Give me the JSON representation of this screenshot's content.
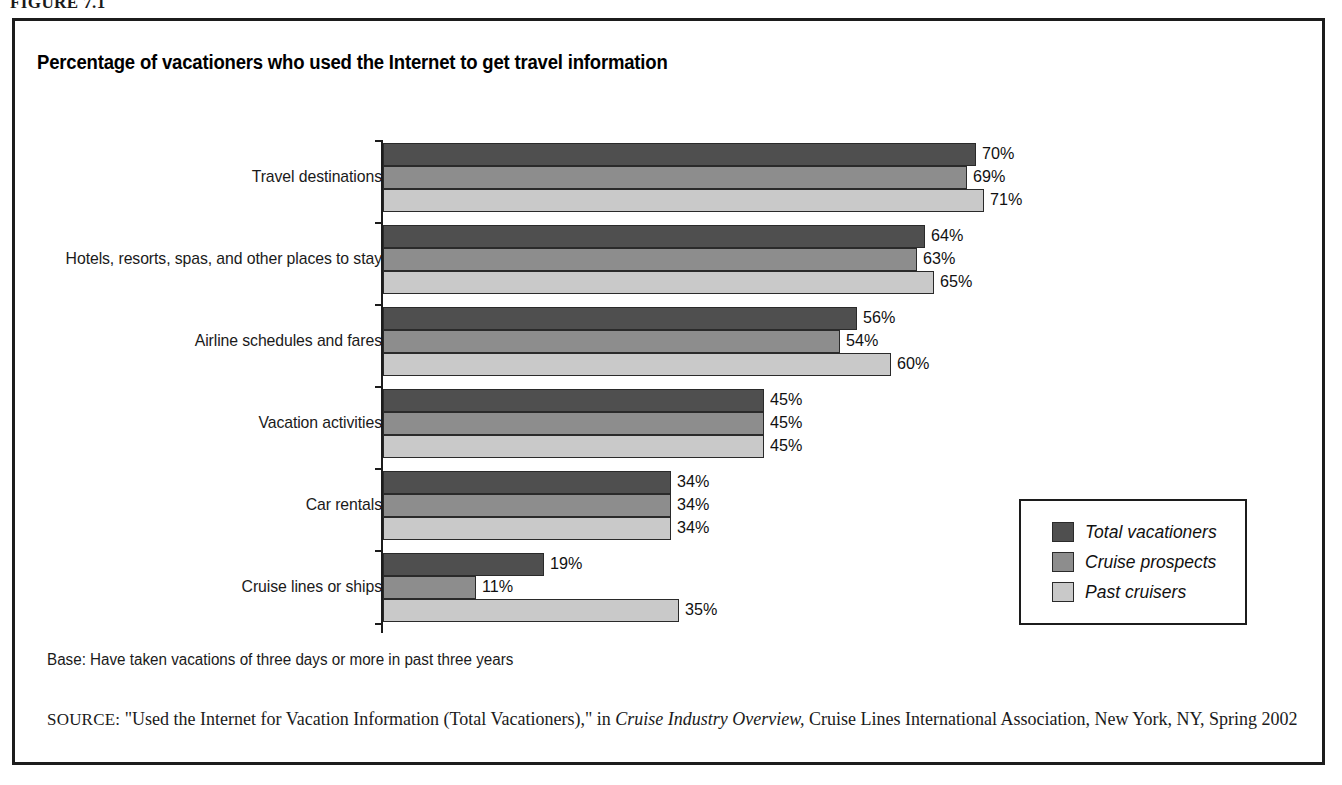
{
  "figure": {
    "caption": "FIGURE 7.1"
  },
  "chart_title": "Percentage of vacationers who used the Internet to get travel information",
  "notes": {
    "base": "Base: Have taken vacations of three days or more in past three years",
    "source_kicker": "SOURCE:",
    "source_part1": " \"Used the Internet for Vacation Information (Total Vacationers),\" in ",
    "source_italic": "Cruise Industry Overview,",
    "source_part2": " Cruise Lines International Association, New York, NY, Spring 2002"
  },
  "legend": {
    "position": "inside-right-lower",
    "items": [
      {
        "label": "Total vacationers",
        "color": "#4f4f4f"
      },
      {
        "label": "Cruise prospects",
        "color": "#8d8d8d"
      },
      {
        "label": "Past cruisers",
        "color": "#c9c9c9"
      }
    ]
  },
  "chart_data": {
    "type": "bar",
    "orientation": "horizontal",
    "title": "Percentage of vacationers who used the Internet to get travel information",
    "xlabel": "",
    "ylabel": "",
    "xlim": [
      0,
      75
    ],
    "grid": false,
    "value_suffix": "%",
    "categories": [
      "Travel destinations",
      "Hotels, resorts, spas, and other places to stay",
      "Airline schedules and fares",
      "Vacation activities",
      "Car rentals",
      "Cruise lines or ships"
    ],
    "series": [
      {
        "name": "Total vacationers",
        "color": "#4f4f4f",
        "values": [
          70,
          64,
          56,
          45,
          34,
          19
        ]
      },
      {
        "name": "Cruise prospects",
        "color": "#8d8d8d",
        "values": [
          69,
          63,
          54,
          45,
          34,
          11
        ]
      },
      {
        "name": "Past cruisers",
        "color": "#c9c9c9",
        "values": [
          71,
          65,
          60,
          45,
          34,
          35
        ]
      }
    ],
    "value_labels": [
      [
        "70%",
        "69%",
        "71%"
      ],
      [
        "64%",
        "63%",
        "65%"
      ],
      [
        "56%",
        "54%",
        "60%"
      ],
      [
        "45%",
        "45%",
        "45%"
      ],
      [
        "34%",
        "34%",
        "34%"
      ],
      [
        "19%",
        "11%",
        "35%"
      ]
    ]
  }
}
